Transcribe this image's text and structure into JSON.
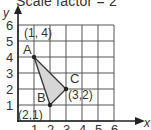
{
  "title": "Scale factor = 2",
  "axes": {
    "x_label": "x",
    "y_label": "y",
    "x_ticks": [
      "1",
      "2",
      "3",
      "4",
      "5",
      "6"
    ],
    "y_ticks": [
      "1",
      "2",
      "3",
      "4",
      "5",
      "6"
    ]
  },
  "grid": {
    "x_range": [
      0,
      6
    ],
    "y_range": [
      0,
      6
    ],
    "step": 1
  },
  "triangle": {
    "fill": "#d6d6d6",
    "stroke": "#3a3a3a",
    "vertices": [
      {
        "name": "A",
        "coord_label": "(1, 4)",
        "x": 1,
        "y": 4
      },
      {
        "name": "B",
        "coord_label": "(2,1)",
        "x": 2,
        "y": 1
      },
      {
        "name": "C",
        "coord_label": "(3,2)",
        "x": 3,
        "y": 2
      }
    ]
  },
  "colors": {
    "grid": "#555555",
    "axis": "#222222",
    "text": "#333333"
  }
}
